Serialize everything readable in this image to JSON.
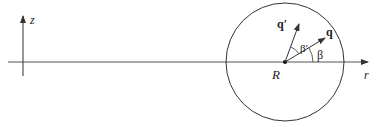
{
  "diagram": {
    "axes": {
      "z_label": "z",
      "r_label": "r"
    },
    "center_label": "R",
    "vectors": [
      {
        "label": "q",
        "angle_label": "β"
      },
      {
        "label": "q′",
        "angle_label": "β′"
      }
    ],
    "colors": {
      "stroke": "#333333",
      "background": "#ffffff"
    }
  }
}
